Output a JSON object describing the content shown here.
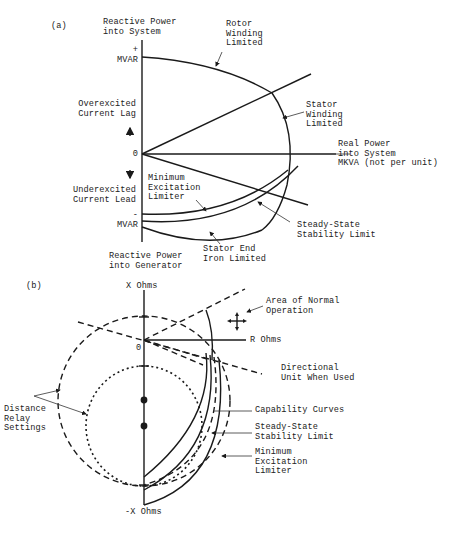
{
  "panel_a": {
    "tag": "(a)",
    "y_axis_top_label": "Reactive Power\ninto System",
    "y_axis_bottom_label": "Reactive Power\ninto Generator",
    "plus_mvar": "+\nMVAR",
    "minus_mvar": "-\nMVAR",
    "origin": "0",
    "overexcited": "Overexcited\nCurrent Lag",
    "underexcited": "Underexcited\nCurrent Lead",
    "x_axis_label": "Real Power\ninto System\nMKVA (not per unit)",
    "rotor_label": "Rotor\nWinding\nLimited",
    "stator_label": "Stator\nWinding\nLimited",
    "mel_label": "Minimum\nExcitation\nLimiter",
    "sssl_label": "Steady-State\nStability Limit",
    "endiron_label": "Stator End\nIron Limited"
  },
  "panel_b": {
    "tag": "(b)",
    "x_ohms": "X Ohms",
    "neg_x_ohms": "-X Ohms",
    "r_ohms": "R Ohms",
    "origin": "0",
    "normal_op": "Area of Normal\nOperation",
    "directional": "Directional\nUnit When Used",
    "distance": "Distance\nRelay\nSettings",
    "capability": "Capability Curves",
    "sssl": "Steady-State\nStability Limit",
    "mel": "Minimum\nExcitation\nLimiter"
  }
}
